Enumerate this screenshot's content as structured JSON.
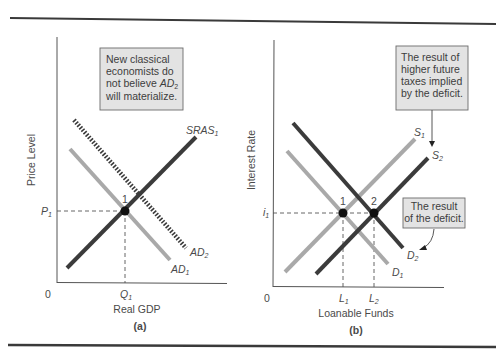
{
  "colors": {
    "dark_curve": "#3b3b3b",
    "light_curve": "#a9a9a9",
    "axis": "#555555",
    "callout_fill": "#e3e3e3",
    "callout_border": "#6a6a6a",
    "rule": "#3a3a3a"
  },
  "panel_a": {
    "caption": "(a)",
    "y_axis_label": "Price Level",
    "x_axis_label": "Real GDP",
    "origin": "0",
    "p_label": "P",
    "p_sub": "1",
    "q_label": "Q",
    "q_sub": "1",
    "point_label": "1",
    "sras_label": "SRAS",
    "sras_sub": "1",
    "ad1_label": "AD",
    "ad1_sub": "1",
    "ad2_label": "AD",
    "ad2_sub": "2",
    "callout": {
      "line1": "New classical",
      "line2": "economists do",
      "line3_prefix": "not believe ",
      "line3_ital": "AD",
      "line3_sub": "2",
      "line4": "will materialize."
    }
  },
  "panel_b": {
    "caption": "(b)",
    "y_axis_label": "Interest Rate",
    "x_axis_label": "Loanable Funds",
    "origin": "0",
    "i_label": "i",
    "i_sub": "1",
    "l1_label": "L",
    "l1_sub": "1",
    "l2_label": "L",
    "l2_sub": "2",
    "point1_label": "1",
    "point2_label": "2",
    "s1_label": "S",
    "s1_sub": "1",
    "s2_label": "S",
    "s2_sub": "2",
    "d1_label": "D",
    "d1_sub": "1",
    "d2_label": "D",
    "d2_sub": "2",
    "callout_top": {
      "line1": "The result of",
      "line2": "higher future",
      "line3": "taxes implied",
      "line4": "by the deficit."
    },
    "callout_bottom": {
      "line1": "The result",
      "line2": "of the deficit."
    }
  }
}
